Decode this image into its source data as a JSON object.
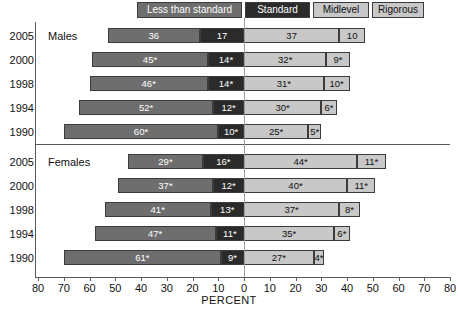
{
  "chart_data": {
    "type": "bar",
    "subtype": "diverging-stacked-horizontal",
    "title": "",
    "xlabel": "PERCENT",
    "ylabel": "",
    "xlim": [
      -80,
      80
    ],
    "xticks": [
      "80",
      "70",
      "60",
      "50",
      "40",
      "30",
      "20",
      "10",
      "0",
      "10",
      "20",
      "30",
      "40",
      "50",
      "60",
      "70",
      "80"
    ],
    "xtick_values": [
      -80,
      -70,
      -60,
      -50,
      -40,
      -30,
      -20,
      -10,
      0,
      10,
      20,
      30,
      40,
      50,
      60,
      70,
      80
    ],
    "grid": false,
    "legend_position": "top",
    "legend": [
      {
        "label": "Less than standard",
        "color": "#6e6e6e",
        "side": "left"
      },
      {
        "label": "Standard",
        "color": "#2b2b2b",
        "side": "left"
      },
      {
        "label": "Midlevel",
        "color": "#c8c8c8",
        "side": "right"
      },
      {
        "label": "Rigorous",
        "color": "#c8c8c8",
        "side": "right"
      }
    ],
    "series": [
      {
        "name": "Less than standard",
        "values": [
          36,
          45,
          46,
          52,
          60,
          29,
          37,
          41,
          47,
          61
        ]
      },
      {
        "name": "Standard",
        "values": [
          17,
          14,
          14,
          12,
          10,
          16,
          12,
          13,
          11,
          9
        ]
      },
      {
        "name": "Midlevel",
        "values": [
          37,
          32,
          31,
          30,
          25,
          44,
          40,
          37,
          35,
          27
        ]
      },
      {
        "name": "Rigorous",
        "values": [
          10,
          9,
          10,
          6,
          5,
          11,
          11,
          8,
          6,
          4
        ]
      }
    ],
    "groups": [
      {
        "name": "Males",
        "rows": [
          {
            "year": "2005",
            "less_than_standard": 36,
            "standard": 17,
            "midlevel": 37,
            "rigorous": 10,
            "labels": {
              "less_than_standard": "36",
              "standard": "17",
              "midlevel": "37",
              "rigorous": "10"
            }
          },
          {
            "year": "2000",
            "less_than_standard": 45,
            "standard": 14,
            "midlevel": 32,
            "rigorous": 9,
            "labels": {
              "less_than_standard": "45*",
              "standard": "14*",
              "midlevel": "32*",
              "rigorous": "9*"
            }
          },
          {
            "year": "1998",
            "less_than_standard": 46,
            "standard": 14,
            "midlevel": 31,
            "rigorous": 10,
            "labels": {
              "less_than_standard": "46*",
              "standard": "14*",
              "midlevel": "31*",
              "rigorous": "10*"
            }
          },
          {
            "year": "1994",
            "less_than_standard": 52,
            "standard": 12,
            "midlevel": 30,
            "rigorous": 6,
            "labels": {
              "less_than_standard": "52*",
              "standard": "12*",
              "midlevel": "30*",
              "rigorous": "6*"
            }
          },
          {
            "year": "1990",
            "less_than_standard": 60,
            "standard": 10,
            "midlevel": 25,
            "rigorous": 5,
            "labels": {
              "less_than_standard": "60*",
              "standard": "10*",
              "midlevel": "25*",
              "rigorous": "5*"
            }
          }
        ]
      },
      {
        "name": "Females",
        "rows": [
          {
            "year": "2005",
            "less_than_standard": 29,
            "standard": 16,
            "midlevel": 44,
            "rigorous": 11,
            "labels": {
              "less_than_standard": "29*",
              "standard": "16*",
              "midlevel": "44*",
              "rigorous": "11*"
            }
          },
          {
            "year": "2000",
            "less_than_standard": 37,
            "standard": 12,
            "midlevel": 40,
            "rigorous": 11,
            "labels": {
              "less_than_standard": "37*",
              "standard": "12*",
              "midlevel": "40*",
              "rigorous": "11*"
            }
          },
          {
            "year": "1998",
            "less_than_standard": 41,
            "standard": 13,
            "midlevel": 37,
            "rigorous": 8,
            "labels": {
              "less_than_standard": "41*",
              "standard": "13*",
              "midlevel": "37*",
              "rigorous": "8*"
            }
          },
          {
            "year": "1994",
            "less_than_standard": 47,
            "standard": 11,
            "midlevel": 35,
            "rigorous": 6,
            "labels": {
              "less_than_standard": "47*",
              "standard": "11*",
              "midlevel": "35*",
              "rigorous": "6*"
            }
          },
          {
            "year": "1990",
            "less_than_standard": 61,
            "standard": 9,
            "midlevel": 27,
            "rigorous": 4,
            "labels": {
              "less_than_standard": "61*",
              "standard": "9*",
              "midlevel": "27*",
              "rigorous": "4*"
            }
          }
        ]
      }
    ]
  }
}
